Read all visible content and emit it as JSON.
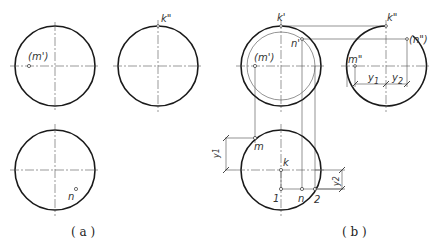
{
  "figure": {
    "panels": [
      {
        "id": "a",
        "caption": "( a )",
        "views": {
          "front": {
            "label": "(m')"
          },
          "side": {
            "label": "k\""
          },
          "top": {
            "label": "n"
          }
        }
      },
      {
        "id": "b",
        "caption": "( b )",
        "views": {
          "front": {
            "labels": [
              "k'",
              "n'",
              "(m')"
            ]
          },
          "side": {
            "labels": [
              "k\"",
              "(n\")",
              "m\"",
              "y1",
              "y2"
            ]
          },
          "top": {
            "labels": [
              "m",
              "k",
              "1",
              "n",
              "2",
              "y1",
              "y2"
            ]
          }
        }
      }
    ]
  },
  "labels": {
    "a_m_front": "(m')",
    "a_k_side": "k\"",
    "a_n_top": "n",
    "b_k_front": "k'",
    "b_n_front": "n'",
    "b_m_front": "(m')",
    "b_k_side": "k\"",
    "b_n_side": "(n\")",
    "b_m_side": "m\"",
    "b_y1_side": "y",
    "b_y1_sub": "1",
    "b_y2_side": "y",
    "b_y2_sub": "2",
    "b_m_top": "m",
    "b_k_top": "k",
    "b_1_top": "1",
    "b_n_top": "n",
    "b_2_top": "2",
    "b_y1_top": "y1",
    "b_y2_top": "y2"
  },
  "captions": {
    "a": "( a )",
    "b": "( b )"
  }
}
